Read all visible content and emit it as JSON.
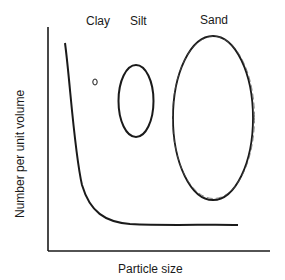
{
  "diagram": {
    "labels": {
      "clay": "Clay",
      "silt": "Silt",
      "sand": "Sand",
      "x_axis": "Particle size",
      "y_axis": "Number per unit volume"
    },
    "colors": {
      "line": "#1a1a1a",
      "background": "#ffffff"
    }
  }
}
